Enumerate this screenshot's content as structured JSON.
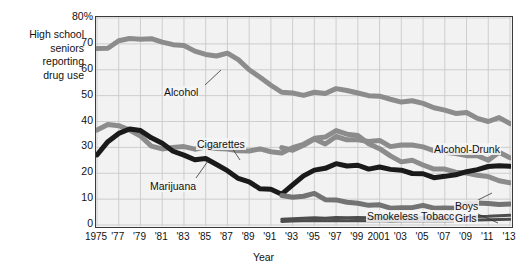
{
  "caption": {
    "y_axis_caption": "High school\nseniors\nreporting\ndrug use"
  },
  "chart_data": {
    "type": "line",
    "title": "",
    "xlabel": "Year",
    "ylabel": "High school seniors reporting drug use",
    "ylim": [
      0,
      80
    ],
    "xlim": [
      1975,
      2013
    ],
    "grid": true,
    "legend_position": "inline-annotations",
    "y_ticks": [
      "0",
      "10",
      "20",
      "30",
      "40",
      "50",
      "60",
      "70",
      "80%"
    ],
    "y_tick_values": [
      0,
      10,
      20,
      30,
      40,
      50,
      60,
      70,
      80
    ],
    "x_ticks": [
      "1975",
      "'77",
      "'79",
      "'81",
      "'83",
      "'85",
      "'87",
      "'89",
      "'91",
      "'93",
      "'95",
      "'97",
      "'99",
      "2001",
      "'03",
      "'05",
      "'07",
      "'09",
      "'11",
      "'13"
    ],
    "x_tick_values": [
      1975,
      1977,
      1979,
      1981,
      1983,
      1985,
      1987,
      1989,
      1991,
      1993,
      1995,
      1997,
      1999,
      2001,
      2003,
      2005,
      2007,
      2009,
      2011,
      2013
    ],
    "x": [
      1975,
      1976,
      1977,
      1978,
      1979,
      1980,
      1981,
      1982,
      1983,
      1984,
      1985,
      1986,
      1987,
      1988,
      1989,
      1990,
      1991,
      1992,
      1993,
      1994,
      1995,
      1996,
      1997,
      1998,
      1999,
      2000,
      2001,
      2002,
      2003,
      2004,
      2005,
      2006,
      2007,
      2008,
      2009,
      2010,
      2011,
      2012,
      2013
    ],
    "series": [
      {
        "name": "Alcohol",
        "color": "#8c8c8c",
        "width": 5,
        "x_start": 1975,
        "values": [
          68.2,
          68.3,
          71.2,
          72.1,
          71.8,
          72.0,
          70.7,
          69.7,
          69.4,
          67.2,
          65.9,
          65.3,
          66.4,
          63.9,
          60.0,
          57.1,
          54.0,
          51.3,
          51.0,
          50.1,
          51.3,
          50.8,
          52.7,
          52.0,
          51.0,
          50.0,
          49.8,
          48.6,
          47.5,
          48.0,
          47.0,
          45.3,
          44.4,
          43.1,
          43.5,
          41.2,
          40.0,
          41.5,
          39.2
        ]
      },
      {
        "name": "Cigarettes",
        "color": "#8c8c8c",
        "width": 5,
        "x_start": 1975,
        "values": [
          36.7,
          38.8,
          38.4,
          36.7,
          34.4,
          30.5,
          29.4,
          30.0,
          30.3,
          29.3,
          30.1,
          29.6,
          29.4,
          28.7,
          28.6,
          29.4,
          28.3,
          27.8,
          29.9,
          31.2,
          33.5,
          34.0,
          36.5,
          35.1,
          34.6,
          31.4,
          29.5,
          26.7,
          24.4,
          25.0,
          23.2,
          21.6,
          21.6,
          20.4,
          20.1,
          19.2,
          18.7,
          17.1,
          16.3
        ]
      },
      {
        "name": "Marijuana",
        "color": "#1a1a1a",
        "width": 5,
        "x_start": 1975,
        "values": [
          27.1,
          32.2,
          35.4,
          37.1,
          36.5,
          33.7,
          31.6,
          28.5,
          27.0,
          25.2,
          25.7,
          23.4,
          21.0,
          18.0,
          16.7,
          14.0,
          13.8,
          11.9,
          15.5,
          19.0,
          21.2,
          21.9,
          23.7,
          22.8,
          23.1,
          21.6,
          22.4,
          21.5,
          21.2,
          19.9,
          19.8,
          18.3,
          18.8,
          19.4,
          20.6,
          21.4,
          22.6,
          22.9,
          22.7
        ]
      },
      {
        "name": "Alcohol-Drunk",
        "color": "#8c8c8c",
        "width": 5,
        "x_start": 1992,
        "values": [
          null,
          null,
          null,
          null,
          null,
          null,
          null,
          null,
          null,
          null,
          null,
          null,
          null,
          null,
          null,
          null,
          null,
          29.9,
          28.9,
          30.8,
          33.2,
          31.3,
          34.2,
          32.9,
          32.9,
          32.3,
          32.7,
          30.3,
          30.9,
          30.9,
          30.2,
          28.7,
          28.1,
          27.6,
          26.8,
          26.8,
          25.0,
          28.1,
          26.0
        ]
      },
      {
        "name": "Smokeless Tobacco",
        "color": "#737373",
        "width": 5,
        "x_start": 1992,
        "values": [
          null,
          null,
          null,
          null,
          null,
          null,
          null,
          null,
          null,
          null,
          null,
          null,
          null,
          null,
          null,
          null,
          null,
          11.4,
          10.7,
          11.1,
          12.2,
          9.8,
          9.7,
          8.8,
          8.4,
          7.6,
          7.8,
          6.5,
          6.7,
          6.7,
          7.6,
          6.5,
          6.6,
          6.5,
          8.4,
          8.5,
          8.3,
          7.9,
          8.1
        ]
      },
      {
        "name": "Boys",
        "color": "#4d4d4d",
        "width": 3,
        "x_start": 1992,
        "values": [
          null,
          null,
          null,
          null,
          null,
          null,
          null,
          null,
          null,
          null,
          null,
          null,
          null,
          null,
          null,
          null,
          null,
          2.2,
          2.4,
          2.6,
          2.8,
          2.6,
          2.9,
          2.8,
          2.9,
          2.8,
          2.9,
          2.6,
          2.7,
          2.7,
          2.8,
          2.7,
          2.8,
          2.8,
          3.2,
          3.3,
          3.4,
          3.6,
          3.8
        ]
      },
      {
        "name": "Girls",
        "color": "#4d4d4d",
        "width": 3,
        "x_start": 1992,
        "values": [
          null,
          null,
          null,
          null,
          null,
          null,
          null,
          null,
          null,
          null,
          null,
          null,
          null,
          null,
          null,
          null,
          null,
          1.4,
          1.5,
          1.6,
          1.7,
          1.6,
          1.7,
          1.6,
          1.7,
          1.6,
          1.7,
          1.5,
          1.6,
          1.6,
          1.6,
          1.6,
          1.6,
          1.6,
          1.8,
          1.9,
          2.0,
          2.1,
          2.2
        ]
      }
    ],
    "annotations": [
      {
        "label": "Alcohol",
        "x": 163,
        "y": 86,
        "leader": [
          [
            205,
            85
          ],
          [
            221,
            70
          ]
        ]
      },
      {
        "label": "Cigarettes",
        "x": 196,
        "y": 138,
        "leader": [
          [
            232,
            148
          ],
          [
            240,
            160
          ]
        ]
      },
      {
        "label": "Marijuana",
        "x": 149,
        "y": 180,
        "leader": [
          [
            196,
            178
          ],
          [
            208,
            161
          ]
        ]
      },
      {
        "label": "Alcohol-Drunk",
        "x": 433,
        "y": 143,
        "leader": []
      },
      {
        "label": "Smokeless Tobacco",
        "x": 366,
        "y": 210,
        "leader": []
      },
      {
        "label": "Boys",
        "x": 454,
        "y": 200,
        "leader": [
          [
            478,
            200
          ],
          [
            492,
            193
          ]
        ]
      },
      {
        "label": "Girls",
        "x": 454,
        "y": 212,
        "leader": [
          [
            478,
            214
          ],
          [
            498,
            223
          ]
        ]
      }
    ]
  }
}
